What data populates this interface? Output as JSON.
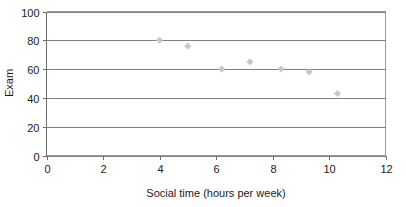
{
  "chart_data": {
    "type": "scatter",
    "title": "",
    "subtitle": "",
    "xlabel": "Social time (hours per week)",
    "ylabel": "Exam",
    "xlim": [
      0,
      12
    ],
    "ylim": [
      0,
      100
    ],
    "xticks": [
      0,
      2,
      4,
      6,
      8,
      10,
      12
    ],
    "yticks": [
      0,
      20,
      40,
      60,
      80,
      100
    ],
    "xtick_labels": [
      "0",
      "2",
      "4",
      "6",
      "8",
      "10",
      "12"
    ],
    "ytick_labels": [
      "0",
      "20",
      "40",
      "60",
      "80",
      "100"
    ],
    "grid": "horizontal",
    "legend": "none",
    "marker": "diamond",
    "marker_color": "#c8c8c8",
    "points": [
      {
        "x": 4,
        "y": 80
      },
      {
        "x": 5,
        "y": 76
      },
      {
        "x": 6.2,
        "y": 60
      },
      {
        "x": 7.2,
        "y": 65
      },
      {
        "x": 8.3,
        "y": 60
      },
      {
        "x": 9.3,
        "y": 58
      },
      {
        "x": 10.3,
        "y": 43
      }
    ],
    "series": [
      {
        "name": "",
        "x": [
          4,
          5,
          6.2,
          7.2,
          8.3,
          9.3,
          10.3
        ],
        "values": [
          80,
          76,
          60,
          65,
          60,
          58,
          43
        ]
      }
    ]
  },
  "colors": {
    "background": "#ffffff",
    "gridline": "#808080",
    "frame": "#9a9a9a",
    "axis": "#6e6e6e",
    "text": "#1a1a1a",
    "marker": "#c8c8c8"
  }
}
